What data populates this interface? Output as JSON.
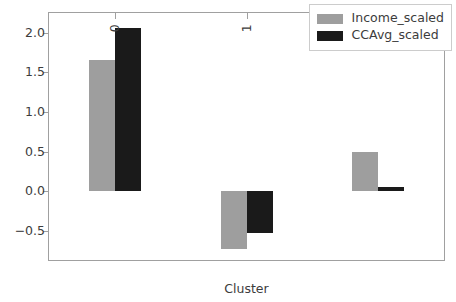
{
  "chart_data": {
    "type": "bar",
    "title": "",
    "xlabel": "Cluster",
    "ylabel": "",
    "categories": [
      "0",
      "1",
      "2"
    ],
    "series": [
      {
        "name": "Income_scaled",
        "color": "#9e9e9e",
        "values": [
          1.66,
          -0.73,
          0.49
        ]
      },
      {
        "name": "CCAvg_scaled",
        "color": "#1a1a1a",
        "values": [
          2.06,
          -0.53,
          0.05
        ]
      }
    ],
    "yticks": [
      2.0,
      1.5,
      1.0,
      0.5,
      0.0,
      -0.5
    ],
    "ytick_labels": [
      "2.0",
      "1.5",
      "1.0",
      "0.5",
      "0.0",
      "−0.5"
    ],
    "ylim": [
      -0.87,
      2.25
    ],
    "grid": false,
    "legend_position": "upper right",
    "xtick_rotation": 90
  },
  "legend": {
    "entries": [
      {
        "label": "Income_scaled",
        "color": "#9e9e9e"
      },
      {
        "label": "CCAvg_scaled",
        "color": "#1a1a1a"
      }
    ]
  },
  "axis": {
    "xlabel": "Cluster"
  }
}
